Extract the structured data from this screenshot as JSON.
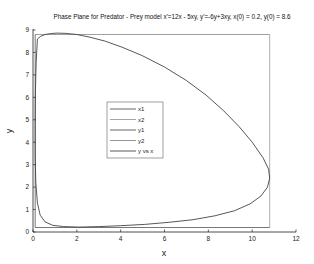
{
  "chart_data": {
    "type": "line",
    "title": "Phase Plane for Predator - Prey model x'=12x - 5xy, y'=-6y+3xy, x(0) = 0.2, y(0) = 8.6",
    "xlabel": "x",
    "ylabel": "y",
    "xlim": [
      0,
      12
    ],
    "ylim": [
      0,
      9
    ],
    "xticks": [
      0,
      2,
      4,
      6,
      8,
      10,
      12
    ],
    "yticks": [
      0,
      1,
      2,
      3,
      4,
      5,
      6,
      7,
      8,
      9
    ],
    "grid": false,
    "legend": {
      "position": "center-left",
      "entries": [
        "x1",
        "x2",
        "y1",
        "y2",
        "y vs x"
      ]
    },
    "series": [
      {
        "name": "x1",
        "type": "vline",
        "x": 0.1,
        "y_range": [
          0.2,
          8.8
        ],
        "color": "#555555"
      },
      {
        "name": "x2",
        "type": "vline",
        "x": 10.8,
        "y_range": [
          0.2,
          8.8
        ],
        "color": "#999999"
      },
      {
        "name": "y1",
        "type": "hline",
        "y": 0.2,
        "x_range": [
          0.1,
          10.8
        ],
        "color": "#555555"
      },
      {
        "name": "y2",
        "type": "hline",
        "y": 8.8,
        "x_range": [
          0.1,
          10.8
        ],
        "color": "#888888"
      },
      {
        "name": "y vs x",
        "type": "line",
        "color": "#444444",
        "x": [
          0.2,
          0.35,
          0.55,
          0.8,
          1.1,
          1.5,
          2.0,
          2.6,
          3.3,
          4.1,
          5.0,
          6.0,
          7.0,
          7.9,
          8.7,
          9.4,
          10.0,
          10.5,
          10.75,
          10.8,
          10.7,
          10.4,
          9.9,
          9.2,
          8.3,
          7.3,
          6.2,
          5.1,
          4.0,
          3.0,
          2.1,
          1.4,
          0.9,
          0.55,
          0.33,
          0.2,
          0.13,
          0.1,
          0.1,
          0.11,
          0.14,
          0.2
        ],
        "y": [
          8.6,
          8.72,
          8.8,
          8.84,
          8.86,
          8.85,
          8.8,
          8.68,
          8.5,
          8.22,
          7.85,
          7.35,
          6.75,
          6.1,
          5.4,
          4.7,
          4.0,
          3.3,
          2.8,
          2.4,
          2.0,
          1.6,
          1.25,
          0.95,
          0.72,
          0.55,
          0.43,
          0.34,
          0.28,
          0.24,
          0.22,
          0.24,
          0.3,
          0.45,
          0.75,
          1.3,
          2.2,
          3.4,
          4.8,
          6.2,
          7.5,
          8.6
        ]
      }
    ]
  }
}
